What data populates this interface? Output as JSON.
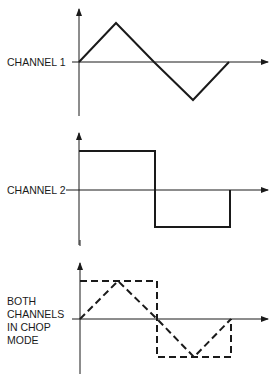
{
  "diagram": {
    "panels": [
      {
        "id": "channel-1",
        "label_lines": [
          "CHANNEL 1"
        ],
        "waveform": "triangle",
        "points": [
          [
            79,
            62
          ],
          [
            116,
            23
          ],
          [
            154,
            62
          ],
          [
            193,
            100
          ],
          [
            229,
            62
          ]
        ]
      },
      {
        "id": "channel-2",
        "label_lines": [
          "CHANNEL 2"
        ],
        "waveform": "square",
        "points": [
          [
            79,
            151
          ],
          [
            155,
            151
          ],
          [
            155,
            227
          ],
          [
            230,
            227
          ],
          [
            230,
            190
          ]
        ]
      },
      {
        "id": "chop-mode",
        "label_lines": [
          "BOTH",
          "CHANNELS",
          "IN CHOP",
          "MODE"
        ],
        "waveform": "triangle + square (dashed)",
        "square_points": [
          [
            80,
            281
          ],
          [
            157,
            281
          ],
          [
            157,
            357
          ],
          [
            231,
            357
          ],
          [
            231,
            319
          ]
        ],
        "triangle_points": [
          [
            80,
            319
          ],
          [
            118,
            281
          ],
          [
            157,
            319
          ],
          [
            194,
            357
          ],
          [
            231,
            319
          ]
        ]
      }
    ]
  }
}
